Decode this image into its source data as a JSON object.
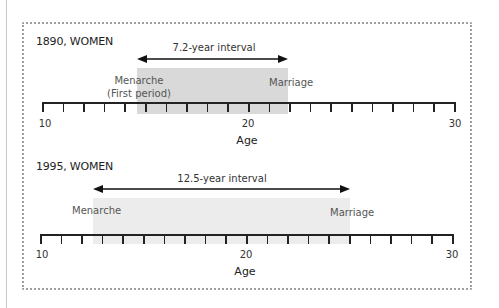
{
  "panels": [
    {
      "title": "1890, WOMEN",
      "interval_label": "7.2-year interval",
      "events": [
        {
          "label": "Menarche",
          "sublabel": "(First period)",
          "age": 14.6
        },
        {
          "label": "Marriage",
          "sublabel": "",
          "age": 21.8
        }
      ],
      "axis": {
        "label": "Age",
        "min": 10,
        "max": 30,
        "tick_labels": [
          "10",
          "20",
          "30"
        ]
      }
    },
    {
      "title": "1995, WOMEN",
      "interval_label": "12.5-year interval",
      "events": [
        {
          "label": "Menarche",
          "sublabel": "",
          "age": 12.6
        },
        {
          "label": "Marriage",
          "sublabel": "",
          "age": 25.1
        }
      ],
      "axis": {
        "label": "Age",
        "min": 10,
        "max": 30,
        "tick_labels": [
          "10",
          "20",
          "30"
        ]
      }
    }
  ],
  "colors": {
    "shade_1890": "#d9d9d9",
    "shade_1995": "#ececec",
    "axis": "#222222",
    "border": "#a0a0a0"
  }
}
